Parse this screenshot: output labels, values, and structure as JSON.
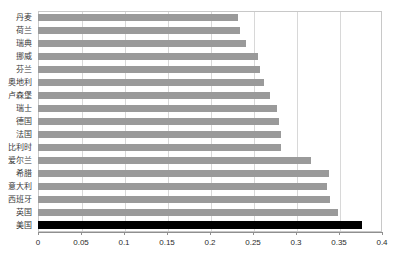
{
  "chart_data": {
    "type": "bar",
    "orientation": "horizontal",
    "title": "",
    "xlabel": "",
    "ylabel": "",
    "xlim": [
      0,
      0.4
    ],
    "xticks": [
      "0",
      "0.05",
      "0.1",
      "0.15",
      "0.2",
      "0.25",
      "0.3",
      "0.35",
      "0.4"
    ],
    "xtick_values": [
      0,
      0.05,
      0.1,
      0.15,
      0.2,
      0.25,
      0.3,
      0.35,
      0.4
    ],
    "grid": "vertical",
    "legend": "none",
    "bar_color": "#9a9a9a",
    "highlight_color": "#000000",
    "categories": [
      "丹麦",
      "荷兰",
      "瑞典",
      "挪威",
      "芬兰",
      "奥地利",
      "卢森堡",
      "瑞士",
      "德国",
      "法国",
      "比利时",
      "爱尔兰",
      "希腊",
      "意大利",
      "西班牙",
      "英国",
      "美国"
    ],
    "values": [
      0.233,
      0.235,
      0.242,
      0.256,
      0.258,
      0.263,
      0.27,
      0.278,
      0.28,
      0.282,
      0.283,
      0.318,
      0.338,
      0.336,
      0.34,
      0.349,
      0.377
    ],
    "highlighted": [
      "美国"
    ]
  }
}
